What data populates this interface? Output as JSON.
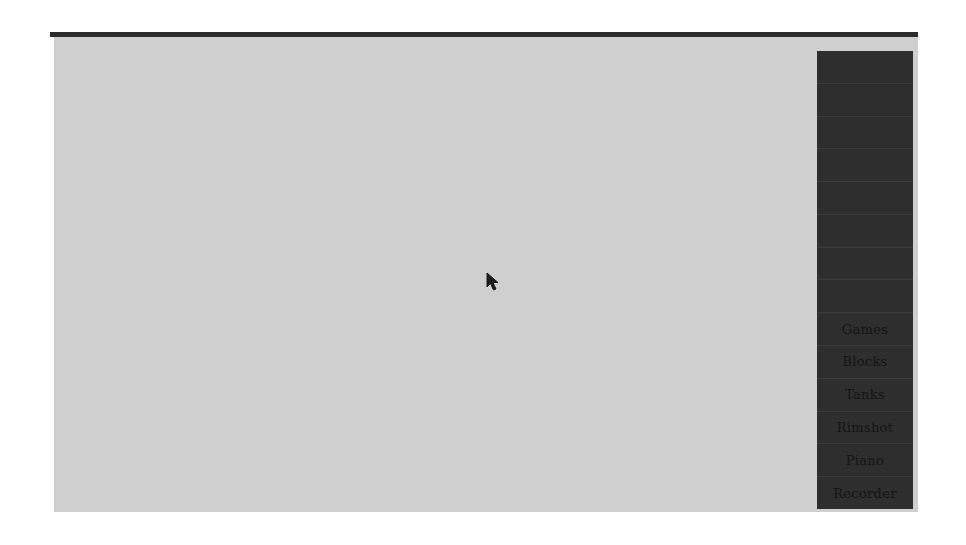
{
  "screen": {
    "background_color": "#ffffff",
    "desktop_color": "#cfcfcf",
    "top_bar_color": "#2b2b2b"
  },
  "menu": {
    "panel_color": "#2e2e2e",
    "items": [
      {
        "label": "",
        "legible": false
      },
      {
        "label": "",
        "legible": false
      },
      {
        "label": "",
        "legible": false
      },
      {
        "label": "",
        "legible": false
      },
      {
        "label": "",
        "legible": false
      },
      {
        "label": "",
        "legible": false
      },
      {
        "label": "",
        "legible": false
      },
      {
        "label": "",
        "legible": false
      },
      {
        "label": "Games",
        "legible": true
      },
      {
        "label": "Blocks",
        "legible": true
      },
      {
        "label": "Tanks",
        "legible": true
      },
      {
        "label": "Rimshot",
        "legible": true
      },
      {
        "label": "Piano",
        "legible": true
      },
      {
        "label": "Recorder",
        "legible": true
      }
    ]
  },
  "cursor": {
    "icon": "arrow-pointer-icon",
    "x": 486,
    "y": 272
  }
}
